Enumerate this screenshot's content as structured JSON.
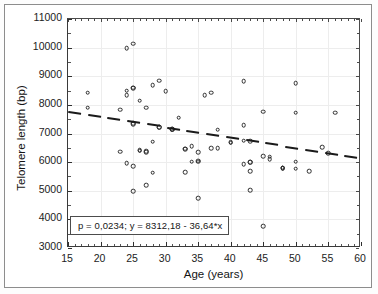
{
  "chart_data": {
    "type": "scatter",
    "title": "",
    "xlabel": "Age (years)",
    "ylabel": "Telomere length (bp)",
    "xlim": [
      15,
      60
    ],
    "ylim": [
      3000,
      11000
    ],
    "xticks": [
      15,
      20,
      25,
      30,
      35,
      40,
      45,
      50,
      55,
      60
    ],
    "yticks": [
      3000,
      4000,
      5000,
      6000,
      7000,
      8000,
      9000,
      10000,
      11000
    ],
    "xtick_labels": [
      "15",
      "20",
      "25",
      "30",
      "35",
      "40",
      "45",
      "50",
      "55",
      "60"
    ],
    "ytick_labels": [
      "3000",
      "4000",
      "5000",
      "6000",
      "7000",
      "8000",
      "9000",
      "10000",
      "11000"
    ],
    "grid": true,
    "legend": null,
    "marker": "open-circle",
    "series": [
      {
        "name": "Subjects",
        "x": [
          18,
          18,
          23,
          23,
          24,
          24,
          24,
          24,
          25,
          25,
          25,
          25,
          25,
          25,
          25,
          26,
          26,
          26,
          27,
          27,
          27,
          27,
          28,
          28,
          28,
          29,
          29,
          29,
          30,
          31,
          31,
          31,
          32,
          33,
          33,
          33,
          34,
          34,
          35,
          35,
          35,
          35,
          36,
          37,
          37,
          38,
          38,
          40,
          40,
          42,
          42,
          42,
          42,
          43,
          43,
          43,
          43,
          43,
          45,
          45,
          45,
          46,
          46,
          48,
          48,
          48,
          50,
          50,
          50,
          50,
          52,
          54,
          55,
          56
        ],
        "y": [
          8420,
          7900,
          7830,
          6360,
          9990,
          8330,
          8500,
          5970,
          10130,
          8580,
          8600,
          7330,
          7350,
          5860,
          4990,
          8140,
          6410,
          6400,
          7900,
          6380,
          6340,
          5200,
          8680,
          6720,
          5630,
          8840,
          7230,
          7210,
          8470,
          7160,
          7130,
          7140,
          7550,
          6470,
          6460,
          5650,
          6560,
          6020,
          6010,
          6340,
          6050,
          4750,
          8340,
          8420,
          6490,
          7130,
          6480,
          6700,
          6680,
          8820,
          7300,
          6750,
          5930,
          6740,
          5990,
          5990,
          5680,
          5010,
          7760,
          6200,
          3760,
          6100,
          6190,
          5790,
          5780,
          5800,
          8750,
          7720,
          6010,
          5770,
          5690,
          6520,
          6320,
          7730
        ]
      }
    ],
    "trendline": {
      "type": "linear-dashed",
      "slope": -36.64,
      "intercept": 8312.18,
      "p_value": 0.0234,
      "x_start": 15,
      "x_end": 60,
      "y_start": 7762.58,
      "y_end": 6113.78
    },
    "annotation": {
      "text": "p = 0,0234;  y = 8312,18 - 36,64*x",
      "boxed": true
    }
  },
  "axis_titles": {
    "x": "Age (years)",
    "y": "Telomere length (bp)"
  },
  "equation_box": {
    "text": "p = 0,0234;  y = 8312,18 - 36,64*x"
  },
  "colors": {
    "frame": "#8d8d8d",
    "axis": "#2f2f2f",
    "marker": "#2b2b2b",
    "trendline": "#1a1a1a",
    "grid": "#ededed",
    "background": "#ffffff"
  }
}
